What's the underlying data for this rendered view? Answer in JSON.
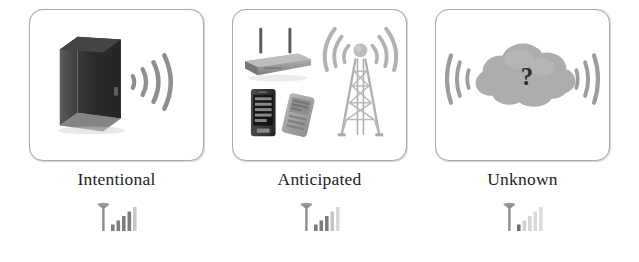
{
  "figure": {
    "title": "",
    "background_color": "#ffffff",
    "panel_border_color": "#a9a9a9",
    "caption_color": "#1d1d1d"
  },
  "panels": [
    {
      "id": "intentional",
      "caption": "Intentional",
      "icon_names": [
        "router-box-icon",
        "wifi-waves-right-icon"
      ],
      "signal_icon_name": "signal-bars-strong-icon",
      "signal_bars_filled": 4,
      "signal_bars_total": 5,
      "art_colors": {
        "device": "#2b2b2b",
        "device_side": "#4a4a4a",
        "waves": "#8f8f8f"
      }
    },
    {
      "id": "anticipated",
      "caption": "Anticipated",
      "icon_names": [
        "wireless-router-icon",
        "smartphone-icon",
        "feature-phone-icon",
        "cell-tower-icon",
        "signal-waves-icon"
      ],
      "signal_icon_name": "signal-bars-medium-icon",
      "signal_bars_filled": 3,
      "signal_bars_total": 5,
      "art_colors": {
        "router": "#9a9a9a",
        "phone_dark": "#3a3a3a",
        "phone_light": "#a6a6a6",
        "tower": "#b3b3b3",
        "waves": "#b0b0b0"
      }
    },
    {
      "id": "unknown",
      "caption": "Unknown",
      "icon_names": [
        "cloud-icon",
        "question-mark-icon",
        "wifi-waves-left-icon",
        "wifi-waves-right-icon"
      ],
      "question_mark": "?",
      "signal_icon_name": "signal-bars-weak-icon",
      "signal_bars_filled": 1,
      "signal_bars_total": 5,
      "art_colors": {
        "cloud": "#adadad",
        "question": "#2a2a2a",
        "waves": "#9d9d9d"
      }
    }
  ]
}
